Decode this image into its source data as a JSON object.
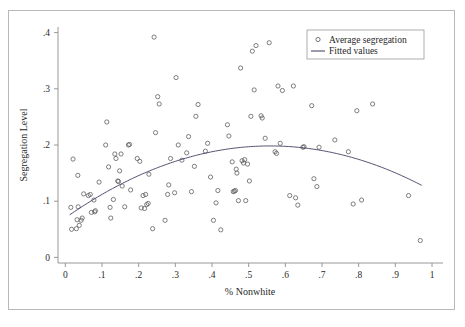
{
  "chart_data": {
    "type": "scatter",
    "title": "",
    "xlabel": "% Nonwhite",
    "ylabel": "Segregation Level",
    "xlim": [
      -0.02,
      1.03
    ],
    "ylim": [
      -0.01,
      0.41
    ],
    "xticks": [
      0,
      0.1,
      0.2,
      0.3,
      0.4,
      0.5,
      0.6,
      0.7,
      0.8,
      0.9,
      1
    ],
    "xticklabels": [
      "0",
      ".1",
      ".2",
      ".3",
      ".4",
      ".5",
      ".6",
      ".7",
      ".8",
      ".9",
      "1"
    ],
    "yticks": [
      0,
      0.1,
      0.2,
      0.3,
      0.4
    ],
    "yticklabels": [
      "0",
      ".1",
      ".2",
      ".3",
      ".4"
    ],
    "grid": false,
    "legend_position": "top-right",
    "legend": [
      {
        "label": "Average segregation",
        "marker": "circle-open",
        "color": "#555555"
      },
      {
        "label": "Fitted values",
        "marker": "line",
        "color": "#4a4a6a"
      }
    ],
    "series": [
      {
        "name": "Average segregation",
        "type": "scatter",
        "marker": "circle-open",
        "color": "#555555",
        "points": [
          [
            0.015,
            0.089
          ],
          [
            0.017,
            0.05
          ],
          [
            0.021,
            0.175
          ],
          [
            0.03,
            0.051
          ],
          [
            0.032,
            0.067
          ],
          [
            0.034,
            0.146
          ],
          [
            0.035,
            0.09
          ],
          [
            0.038,
            0.057
          ],
          [
            0.043,
            0.066
          ],
          [
            0.046,
            0.07
          ],
          [
            0.05,
            0.113
          ],
          [
            0.063,
            0.11
          ],
          [
            0.068,
            0.112
          ],
          [
            0.071,
            0.08
          ],
          [
            0.078,
            0.102
          ],
          [
            0.08,
            0.081
          ],
          [
            0.082,
            0.083
          ],
          [
            0.092,
            0.134
          ],
          [
            0.11,
            0.2
          ],
          [
            0.113,
            0.241
          ],
          [
            0.118,
            0.161
          ],
          [
            0.122,
            0.089
          ],
          [
            0.124,
            0.07
          ],
          [
            0.131,
            0.103
          ],
          [
            0.135,
            0.184
          ],
          [
            0.138,
            0.176
          ],
          [
            0.143,
            0.136
          ],
          [
            0.145,
            0.135
          ],
          [
            0.148,
            0.154
          ],
          [
            0.152,
            0.184
          ],
          [
            0.155,
            0.127
          ],
          [
            0.162,
            0.09
          ],
          [
            0.172,
            0.2
          ],
          [
            0.175,
            0.201
          ],
          [
            0.178,
            0.12
          ],
          [
            0.196,
            0.176
          ],
          [
            0.203,
            0.171
          ],
          [
            0.207,
            0.088
          ],
          [
            0.212,
            0.11
          ],
          [
            0.216,
            0.087
          ],
          [
            0.219,
            0.112
          ],
          [
            0.222,
            0.094
          ],
          [
            0.226,
            0.096
          ],
          [
            0.228,
            0.148
          ],
          [
            0.238,
            0.051
          ],
          [
            0.242,
            0.392
          ],
          [
            0.246,
            0.222
          ],
          [
            0.252,
            0.286
          ],
          [
            0.256,
            0.273
          ],
          [
            0.272,
            0.066
          ],
          [
            0.279,
            0.112
          ],
          [
            0.282,
            0.129
          ],
          [
            0.287,
            0.176
          ],
          [
            0.298,
            0.115
          ],
          [
            0.302,
            0.32
          ],
          [
            0.308,
            0.2
          ],
          [
            0.318,
            0.173
          ],
          [
            0.331,
            0.186
          ],
          [
            0.336,
            0.215
          ],
          [
            0.344,
            0.117
          ],
          [
            0.352,
            0.162
          ],
          [
            0.356,
            0.251
          ],
          [
            0.362,
            0.272
          ],
          [
            0.382,
            0.189
          ],
          [
            0.388,
            0.203
          ],
          [
            0.396,
            0.143
          ],
          [
            0.404,
            0.066
          ],
          [
            0.411,
            0.097
          ],
          [
            0.416,
            0.119
          ],
          [
            0.424,
            0.049
          ],
          [
            0.442,
            0.236
          ],
          [
            0.446,
            0.216
          ],
          [
            0.455,
            0.17
          ],
          [
            0.458,
            0.117
          ],
          [
            0.461,
            0.118
          ],
          [
            0.464,
            0.119
          ],
          [
            0.466,
            0.157
          ],
          [
            0.468,
            0.15
          ],
          [
            0.472,
            0.101
          ],
          [
            0.478,
            0.337
          ],
          [
            0.482,
            0.172
          ],
          [
            0.486,
            0.168
          ],
          [
            0.489,
            0.174
          ],
          [
            0.492,
            0.101
          ],
          [
            0.497,
            0.166
          ],
          [
            0.502,
            0.136
          ],
          [
            0.506,
            0.251
          ],
          [
            0.51,
            0.367
          ],
          [
            0.515,
            0.298
          ],
          [
            0.52,
            0.377
          ],
          [
            0.534,
            0.252
          ],
          [
            0.537,
            0.248
          ],
          [
            0.545,
            0.212
          ],
          [
            0.556,
            0.382
          ],
          [
            0.572,
            0.188
          ],
          [
            0.576,
            0.185
          ],
          [
            0.58,
            0.305
          ],
          [
            0.586,
            0.203
          ],
          [
            0.592,
            0.297
          ],
          [
            0.612,
            0.11
          ],
          [
            0.622,
            0.305
          ],
          [
            0.628,
            0.106
          ],
          [
            0.634,
            0.093
          ],
          [
            0.648,
            0.196
          ],
          [
            0.651,
            0.197
          ],
          [
            0.672,
            0.27
          ],
          [
            0.678,
            0.14
          ],
          [
            0.686,
            0.126
          ],
          [
            0.692,
            0.196
          ],
          [
            0.735,
            0.209
          ],
          [
            0.772,
            0.188
          ],
          [
            0.785,
            0.095
          ],
          [
            0.795,
            0.261
          ],
          [
            0.808,
            0.102
          ],
          [
            0.838,
            0.273
          ],
          [
            0.936,
            0.11
          ],
          [
            0.968,
            0.03
          ]
        ]
      },
      {
        "name": "Fitted values",
        "type": "line",
        "color": "#4a4a6a",
        "curve": {
          "a": 0.0703,
          "b": 0.4585,
          "c": -0.4105
        },
        "x_start": 0.012,
        "x_end": 0.972,
        "points": [
          [
            0.012,
            0.0757
          ],
          [
            0.062,
            0.0972
          ],
          [
            0.112,
            0.1166
          ],
          [
            0.162,
            0.134
          ],
          [
            0.212,
            0.1493
          ],
          [
            0.262,
            0.1625
          ],
          [
            0.312,
            0.1737
          ],
          [
            0.362,
            0.1829
          ],
          [
            0.412,
            0.19
          ],
          [
            0.462,
            0.195
          ],
          [
            0.512,
            0.198
          ],
          [
            0.562,
            0.1989
          ],
          [
            0.612,
            0.1978
          ],
          [
            0.662,
            0.1946
          ],
          [
            0.712,
            0.1893
          ],
          [
            0.762,
            0.182
          ],
          [
            0.812,
            0.1727
          ],
          [
            0.862,
            0.1612
          ],
          [
            0.912,
            0.1478
          ],
          [
            0.972,
            0.129
          ]
        ]
      }
    ]
  }
}
